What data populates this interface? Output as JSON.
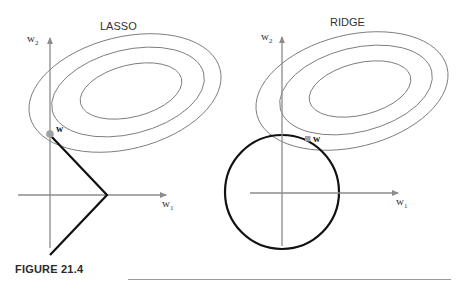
{
  "figure": {
    "caption": "FIGURE 21.4",
    "colors": {
      "axis": "#8c8c8c",
      "contour": "#7a7a7a",
      "constraint": "#111111",
      "point": "#a0a0a0",
      "text": "#333333"
    }
  },
  "panels": [
    {
      "title": "LASSO",
      "y_axis_label": "w",
      "y_axis_sub": "2",
      "x_axis_label": "w",
      "x_axis_sub": "1",
      "point_label": "w",
      "constraint": "diamond"
    },
    {
      "title": "RIDGE",
      "y_axis_label": "w",
      "y_axis_sub": "2",
      "x_axis_label": "w",
      "x_axis_sub": "1",
      "point_label": "w",
      "constraint": "circle"
    }
  ]
}
